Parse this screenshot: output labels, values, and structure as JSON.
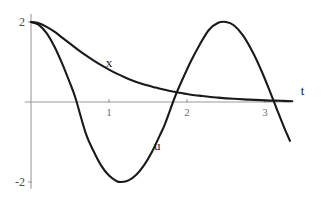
{
  "chart_data": {
    "type": "line",
    "title": "",
    "xlabel": "t",
    "ylabel": "",
    "xlim": [
      -0.08,
      3.4
    ],
    "ylim": [
      -2.15,
      2.15
    ],
    "grid": false,
    "legend_position": "inline-annotation",
    "x_ticks": [
      {
        "value": 1,
        "label": "1"
      },
      {
        "value": 2,
        "label": "2"
      },
      {
        "value": 3,
        "label": "3"
      }
    ],
    "y_ticks": [
      {
        "value": 2,
        "label": "2"
      },
      {
        "value": -2,
        "label": "-2"
      }
    ],
    "annotations": [
      {
        "text": "x",
        "t": 1.0,
        "y": 0.88
      },
      {
        "text": "u",
        "t": 1.62,
        "y": -1.2
      },
      {
        "text": "t",
        "t": 3.48,
        "y": 0.18
      }
    ],
    "series": [
      {
        "name": "x",
        "label": "x",
        "color": "#1a1a1a",
        "description": "decaying exponential starting at 2 approaching 0",
        "x": [
          0.0,
          0.1,
          0.2,
          0.3,
          0.4,
          0.5,
          0.6,
          0.7,
          0.8,
          0.9,
          1.0,
          1.1,
          1.2,
          1.3,
          1.4,
          1.5,
          1.6,
          1.7,
          1.8,
          1.9,
          2.0,
          2.1,
          2.2,
          2.4,
          2.6,
          2.8,
          3.0,
          3.2,
          3.35
        ],
        "y": [
          2.0,
          1.97,
          1.88,
          1.76,
          1.61,
          1.46,
          1.31,
          1.17,
          1.04,
          0.92,
          0.81,
          0.71,
          0.62,
          0.54,
          0.47,
          0.41,
          0.36,
          0.31,
          0.27,
          0.23,
          0.2,
          0.17,
          0.15,
          0.11,
          0.08,
          0.06,
          0.04,
          0.03,
          0.02
        ]
      },
      {
        "name": "u",
        "label": "u",
        "color": "#1a1a1a",
        "description": "cosine-like oscillation amplitude 2 starting at 2",
        "x": [
          0.0,
          0.1,
          0.2,
          0.3,
          0.4,
          0.5,
          0.57,
          0.7,
          0.8,
          0.9,
          1.0,
          1.1,
          1.16,
          1.25,
          1.35,
          1.45,
          1.55,
          1.65,
          1.72,
          1.85,
          1.95,
          2.05,
          2.15,
          2.28,
          2.4,
          2.5,
          2.6,
          2.72,
          2.85,
          2.95,
          3.05,
          3.15,
          3.25,
          3.32
        ],
        "y": [
          2.0,
          1.93,
          1.72,
          1.39,
          0.96,
          0.47,
          0.1,
          -0.77,
          -1.22,
          -1.59,
          -1.84,
          -1.98,
          -2.0,
          -1.96,
          -1.82,
          -1.58,
          -1.25,
          -0.84,
          -0.54,
          0.15,
          0.6,
          1.02,
          1.39,
          1.8,
          1.98,
          2.0,
          1.92,
          1.66,
          1.22,
          0.8,
          0.33,
          -0.17,
          -0.66,
          -0.97
        ]
      }
    ]
  },
  "figure": {
    "background_color": "#ffffff",
    "axis_color": "#9a9a9a",
    "curve_color": "#1a1a1a"
  }
}
